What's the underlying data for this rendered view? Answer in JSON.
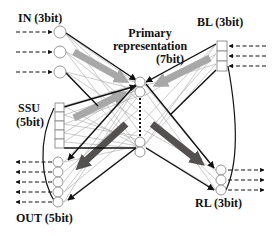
{
  "diagram": {
    "labels": {
      "in": "IN (3bit)",
      "primary_line1": "Primary",
      "primary_line2": "representation",
      "primary_line3": "(7bit)",
      "bl": "BL (3bit)",
      "ssu_line1": "SSU",
      "ssu_line2": "(5bit)",
      "out": "OUT (5bit)",
      "rl": "RL (3bit)"
    },
    "groups": [
      {
        "id": "in",
        "label": "IN (3bit)",
        "units": 3,
        "shape": "circle",
        "io": "input"
      },
      {
        "id": "bl",
        "label": "BL (3bit)",
        "units": 3,
        "shape": "square",
        "io": "input"
      },
      {
        "id": "ssu",
        "label": "SSU (5bit)",
        "units": 5,
        "shape": "square",
        "io": "internal"
      },
      {
        "id": "primary",
        "label": "Primary representation (7bit)",
        "units": 7,
        "shape": "circle",
        "io": "hidden"
      },
      {
        "id": "out",
        "label": "OUT (5bit)",
        "units": 5,
        "shape": "circle",
        "io": "output"
      },
      {
        "id": "rl",
        "label": "RL (3bit)",
        "units": 3,
        "shape": "circle",
        "io": "output"
      }
    ],
    "edges": [
      {
        "from": "in",
        "to": "primary",
        "style": "black-arrow"
      },
      {
        "from": "bl",
        "to": "primary",
        "style": "black-arrow"
      },
      {
        "from": "ssu",
        "to": "primary",
        "style": "black-arrow"
      },
      {
        "from": "primary",
        "to": "out",
        "style": "black-arrow + dark-gray thick arrow"
      },
      {
        "from": "primary",
        "to": "rl",
        "style": "black-arrow + dark-gray thick arrow"
      },
      {
        "from": "in",
        "to": "primary",
        "style": "light-gray thick arrow"
      },
      {
        "from": "bl",
        "to": "primary",
        "style": "light-gray thick arrow"
      },
      {
        "from": "ssu",
        "to": "primary",
        "style": "light-gray thick arrow"
      },
      {
        "from": "bl",
        "to": "rl",
        "style": "curved feedback line"
      },
      {
        "from": "ssu",
        "to": "out",
        "style": "curved feedback line"
      }
    ],
    "colors": {
      "stroke": "#111111",
      "light_arrow": "#a8a8a8",
      "dark_arrow": "#555050",
      "thin_lines": "#9a9a9a",
      "node_fill": "#ffffff",
      "node_stroke": "#8a8a8a"
    }
  }
}
